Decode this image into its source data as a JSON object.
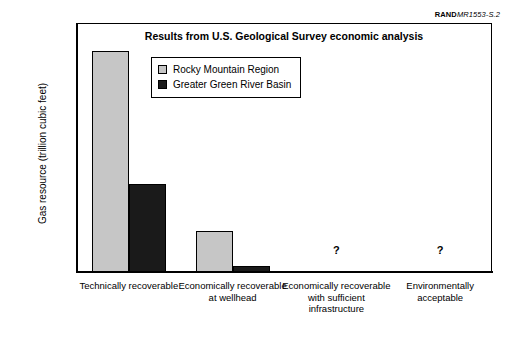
{
  "credit": {
    "brand": "RAND",
    "document": "MR1553-S.2"
  },
  "chart_data": {
    "type": "bar",
    "title": "Results from U.S. Geological Survey economic analysis",
    "xlabel": "",
    "ylabel": "Gas resource (trillion cubic feet)",
    "ylim": [
      0,
      350
    ],
    "ytick_step": 50,
    "yticks": [
      0,
      50,
      100,
      150,
      200,
      250,
      300,
      350
    ],
    "ytick_labels": [
      "0",
      "50",
      "100",
      "150",
      "200",
      "250",
      "300",
      "350"
    ],
    "minor_tick_step": 10,
    "grid": false,
    "legend_position": "upper-left-inside",
    "categories": [
      "Technically recoverable",
      "Economically recoverable at wellhead",
      "Economically recoverable with sufficient infrastructure",
      "Environmentally acceptable"
    ],
    "series": [
      {
        "name": "Rocky Mountain Region",
        "color": "#c6c6c6",
        "values": [
          310,
          57,
          null,
          null
        ]
      },
      {
        "name": "Greater Green River Basin",
        "color": "#1a1a1a",
        "values": [
          124,
          8,
          null,
          null
        ]
      }
    ],
    "annotations": [
      {
        "text": "?",
        "category_index": 2,
        "value": 30
      },
      {
        "text": "?",
        "category_index": 3,
        "value": 30
      }
    ]
  }
}
